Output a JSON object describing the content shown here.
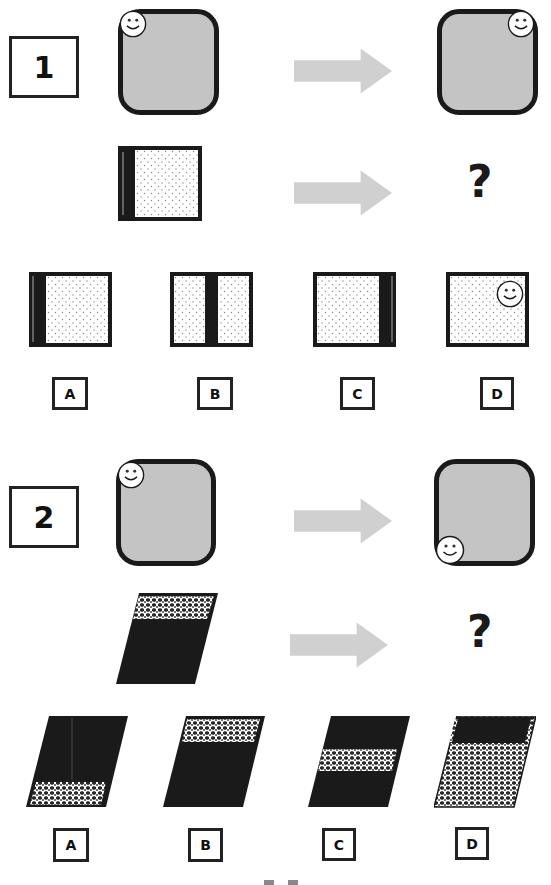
{
  "colors": {
    "ink": "#1a1a1a",
    "box_fill": "#c4c4c4",
    "arrow": "#d0d0d0",
    "dotted_fill": "#ffffff"
  },
  "puzzles": [
    {
      "number": "1",
      "example": {
        "before": {
          "shape": "rounded-square",
          "smiley_corner": "top-left"
        },
        "after": {
          "shape": "rounded-square",
          "smiley_corner": "top-right"
        }
      },
      "question": {
        "shape": "dotted-square-with-black-left-band",
        "answer_placeholder": "?"
      },
      "options": [
        {
          "label": "A",
          "description": "dotted square with black band on left"
        },
        {
          "label": "B",
          "description": "dotted square with black band in middle"
        },
        {
          "label": "C",
          "description": "dotted square with black band on right"
        },
        {
          "label": "D",
          "description": "dotted square with smiley top-right"
        }
      ]
    },
    {
      "number": "2",
      "example": {
        "before": {
          "shape": "rounded-square",
          "smiley_corner": "top-left"
        },
        "after": {
          "shape": "rounded-square",
          "smiley_corner": "bottom-left"
        }
      },
      "question": {
        "shape": "black-parallelogram-with-pattern-top-band",
        "answer_placeholder": "?"
      },
      "options": [
        {
          "label": "A",
          "description": "black parallelogram, pattern band at bottom"
        },
        {
          "label": "B",
          "description": "black parallelogram, pattern band at top"
        },
        {
          "label": "C",
          "description": "black parallelogram, pattern band in middle"
        },
        {
          "label": "D",
          "description": "pattern parallelogram, black band at top"
        }
      ]
    }
  ]
}
